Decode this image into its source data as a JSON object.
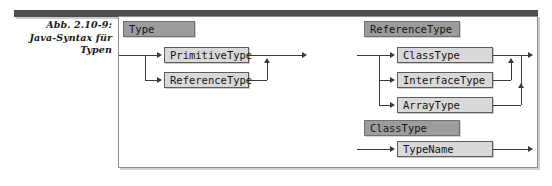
{
  "figure": {
    "caption_lines": [
      "Abb. 2.10-9:",
      "Java-Syntax für",
      "Typen"
    ],
    "caption_full": "Abb. 2.10-9: Java-Syntax für Typen"
  },
  "colors": {
    "rule_head_fill": "#9c9c9c",
    "symbol_box_fill": "#d9d9d9",
    "line": "#3a3a3a",
    "top_rule": "#4e4e4e",
    "pane_border": "#8d8d8d",
    "page_background": "#ffffff"
  },
  "diagram": {
    "type": "syntax-railroad",
    "rules": [
      {
        "name": "Type",
        "alternatives": [
          "PrimitiveType",
          "ReferenceType"
        ]
      },
      {
        "name": "ReferenceType",
        "alternatives": [
          "ClassType",
          "InterfaceType",
          "ArrayType"
        ]
      },
      {
        "name": "ClassType",
        "alternatives": [
          "TypeName"
        ]
      }
    ]
  },
  "nodes": {
    "rule1_head": "Type",
    "rule1_alt1": "PrimitiveType",
    "rule1_alt2": "ReferenceType",
    "rule2_head": "ReferenceType",
    "rule2_alt1": "ClassType",
    "rule2_alt2": "InterfaceType",
    "rule2_alt3": "ArrayType",
    "rule3_head": "ClassType",
    "rule3_alt1": "TypeName"
  }
}
